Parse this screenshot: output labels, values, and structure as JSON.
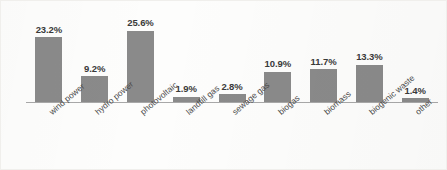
{
  "chart_data": {
    "type": "bar",
    "title": "",
    "subtitle": "",
    "xlabel": "",
    "ylabel": "",
    "ylim": [
      0,
      28
    ],
    "grid": false,
    "legend": false,
    "legend_position": "none",
    "orientation": "vertical",
    "value_suffix": "%",
    "bar_color": "#8a8a8a",
    "axis_color": "#a8a8a8",
    "label_color": "#3a3a3a",
    "background_color": "#fdfdfc",
    "categories": [
      "wind power",
      "hydro power",
      "photovoltaic",
      "landfill gas",
      "sewage gas",
      "biogas",
      "biomass",
      "biogenic waste",
      "other"
    ],
    "values": [
      23.2,
      9.2,
      25.6,
      1.9,
      2.8,
      10.9,
      11.7,
      13.3,
      1.4
    ],
    "value_labels": [
      "23.2%",
      "9.2%",
      "25.6%",
      "1.9%",
      "2.8%",
      "10.9%",
      "11.7%",
      "13.3%",
      "1.4%"
    ],
    "series": [
      {
        "name": "share",
        "values": [
          23.2,
          9.2,
          25.6,
          1.9,
          2.8,
          10.9,
          11.7,
          13.3,
          1.4
        ]
      }
    ]
  }
}
